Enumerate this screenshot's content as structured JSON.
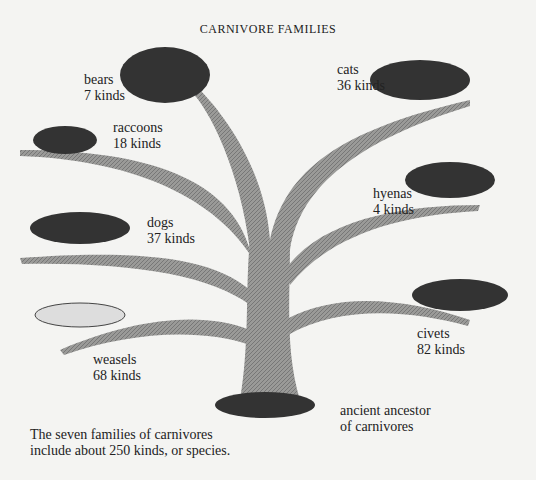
{
  "title": "CARNIVORE FAMILIES",
  "families": [
    {
      "name": "bears",
      "count": "7 kinds"
    },
    {
      "name": "cats",
      "count": "36 kinds"
    },
    {
      "name": "raccoons",
      "count": "18 kinds"
    },
    {
      "name": "hyenas",
      "count": "4 kinds"
    },
    {
      "name": "dogs",
      "count": "37 kinds"
    },
    {
      "name": "civets",
      "count": "82 kinds"
    },
    {
      "name": "weasels",
      "count": "68 kinds"
    }
  ],
  "ancestor": {
    "line1": "ancient ancestor",
    "line2": "of carnivores"
  },
  "caption": {
    "line1": "The seven families of carnivores",
    "line2": "include about 250 kinds, or species."
  }
}
